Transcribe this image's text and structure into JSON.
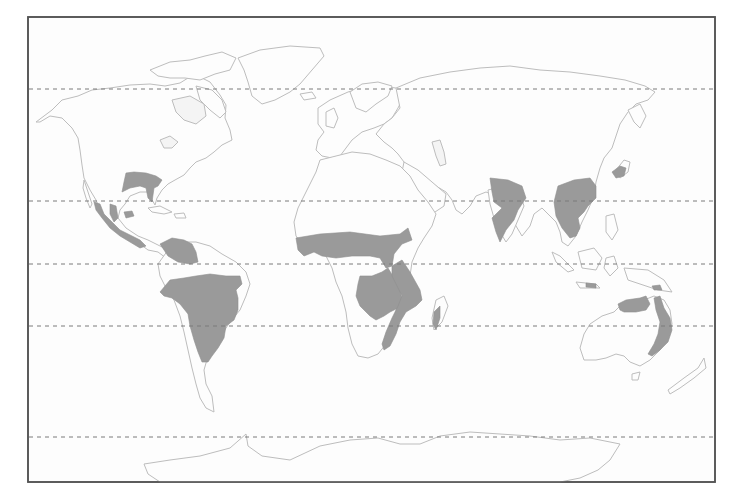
{
  "map": {
    "type": "world-map-biome-distribution",
    "colors": {
      "background": "#fdfdfd",
      "frame": "#555555",
      "coastline": "#bdbdbd",
      "shaded_region": "#9a9a9a",
      "latitude_lines": "#7a7a7a"
    },
    "frame": {
      "x": 28,
      "y": 17,
      "width": 687,
      "height": 465
    },
    "latitude_lines": [
      {
        "id": "arctic-circle",
        "y": 89
      },
      {
        "id": "tropic-of-cancer",
        "y": 201
      },
      {
        "id": "equator",
        "y": 264
      },
      {
        "id": "tropic-of-capricorn",
        "y": 326
      },
      {
        "id": "antarctic-circle",
        "y": 437
      }
    ],
    "shaded_regions": [
      {
        "id": "southern-north-america",
        "continent": "North America"
      },
      {
        "id": "mexico-central-america",
        "continent": "North America"
      },
      {
        "id": "cuba",
        "continent": "North America"
      },
      {
        "id": "venezuela-llanos",
        "continent": "South America"
      },
      {
        "id": "brazil-cerrado-chaco",
        "continent": "South America"
      },
      {
        "id": "sahel-sudan-belt",
        "continent": "Africa"
      },
      {
        "id": "southern-africa-miombo",
        "continent": "Africa"
      },
      {
        "id": "east-africa",
        "continent": "Africa"
      },
      {
        "id": "madagascar-west",
        "continent": "Africa"
      },
      {
        "id": "india",
        "continent": "Asia"
      },
      {
        "id": "indochina-south-china",
        "continent": "Asia"
      },
      {
        "id": "japan",
        "continent": "Asia"
      },
      {
        "id": "northern-australia",
        "continent": "Australia"
      },
      {
        "id": "eastern-australia",
        "continent": "Australia"
      },
      {
        "id": "indonesia-lesser-sunda",
        "continent": "Asia"
      }
    ]
  }
}
